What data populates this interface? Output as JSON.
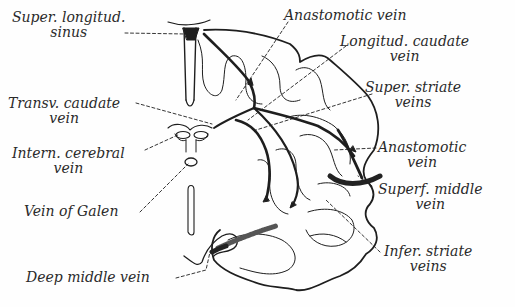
{
  "diagram": {
    "type": "anatomical-illustration",
    "colors": {
      "ink": "#1e1e1e",
      "label": "#2a2a2a",
      "background": "#fefefe"
    },
    "labels": {
      "super_longitud_sinus": {
        "line1": "Super. longitud.",
        "line2": "sinus"
      },
      "anastomotic_vein_top": {
        "line1": "Anastomotic vein"
      },
      "longitud_caudate_vein": {
        "line1": "Longitud. caudate",
        "line2": "vein"
      },
      "super_striate_veins": {
        "line1": "Super. striate",
        "line2": "veins"
      },
      "transv_caudate_vein": {
        "line1": "Transv. caudate",
        "line2": "vein"
      },
      "intern_cerebral_vein": {
        "line1": "Intern. cerebral",
        "line2": "vein"
      },
      "vein_of_galen": {
        "line1": "Vein of Galen"
      },
      "anastomotic_vein_right": {
        "line1": "Anastomotic",
        "line2": "vein"
      },
      "superf_middle_vein": {
        "line1": "Superf. middle",
        "line2": "vein"
      },
      "infer_striate_veins": {
        "line1": "Infer. striate",
        "line2": "veins"
      },
      "deep_middle_vein": {
        "line1": "Deep middle vein"
      }
    }
  }
}
